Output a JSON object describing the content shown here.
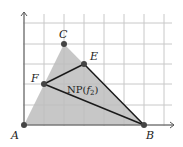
{
  "figure": {
    "type": "newton-polygon-diagram",
    "grid": {
      "x_lines": [
        24,
        44,
        64,
        84,
        104,
        124,
        144,
        164
      ],
      "y_lines": [
        23,
        44,
        64,
        84,
        105,
        125
      ],
      "color": "#c8c8c8"
    },
    "axes": {
      "origin": [
        24,
        125
      ],
      "x_end": 174,
      "y_end": 12,
      "color": "#555555"
    },
    "shaded_region": {
      "vertices": [
        "A",
        "B",
        "C"
      ],
      "color": "#bdbdbd"
    },
    "polygon_label": {
      "prefix": "NP(",
      "func": "f",
      "sub": "2",
      "suffix": ")"
    },
    "points": [
      {
        "name": "A",
        "x": 24,
        "y": 125,
        "label_dx": -13,
        "label_dy": 14
      },
      {
        "name": "B",
        "x": 144,
        "y": 125,
        "label_dx": 2,
        "label_dy": 14
      },
      {
        "name": "C",
        "x": 64,
        "y": 44,
        "label_dx": -5,
        "label_dy": -6
      },
      {
        "name": "E",
        "x": 84,
        "y": 64,
        "label_dx": 6,
        "label_dy": -4
      },
      {
        "name": "F",
        "x": 44,
        "y": 84,
        "label_dx": -13,
        "label_dy": -2
      }
    ],
    "edges": [
      [
        "F",
        "E"
      ],
      [
        "E",
        "B"
      ],
      [
        "B",
        "F"
      ]
    ],
    "point_color": "#444444",
    "edge_color": "#1a1a1a"
  }
}
